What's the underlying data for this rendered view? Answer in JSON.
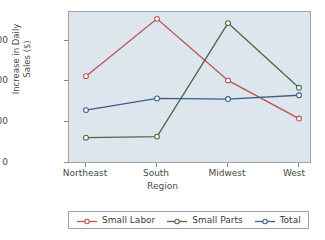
{
  "chart_data": {
    "type": "line",
    "title": "",
    "xlabel": "Region",
    "ylabel": "Increase in Daily\nSales ($)",
    "categories": [
      "Northeast",
      "South",
      "Midwest",
      "West"
    ],
    "yticks": [
      0,
      200,
      400,
      600
    ],
    "ylim": [
      0,
      700
    ],
    "grid": false,
    "legend_position": "bottom",
    "series": [
      {
        "name": "Small Labor",
        "color": "#c0504d",
        "values": [
          400,
          670,
          380,
          200
        ]
      },
      {
        "name": "Small Parts",
        "color": "#4a6a41",
        "values": [
          110,
          115,
          650,
          345
        ]
      },
      {
        "name": "Total",
        "color": "#3c5f8a",
        "values": [
          240,
          295,
          292,
          310
        ]
      }
    ]
  },
  "axis": {
    "ytick_0": "0",
    "ytick_1": "200",
    "ytick_2": "400",
    "ytick_3": "600",
    "xtick_0": "Northeast",
    "xtick_1": "South",
    "xtick_2": "Midwest",
    "xtick_3": "West",
    "xtitle": "Region",
    "ytitle": "Increase in Daily\nSales ($)"
  },
  "legend": {
    "items": [
      {
        "label": "Small Labor"
      },
      {
        "label": "Small Parts"
      },
      {
        "label": "Total"
      }
    ]
  }
}
